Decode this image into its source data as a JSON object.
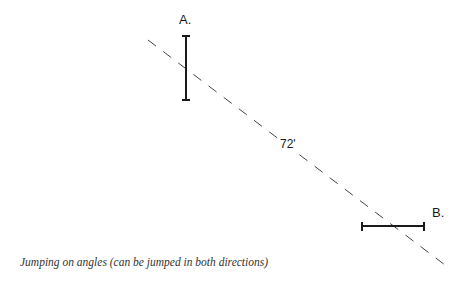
{
  "diagram": {
    "title": "Jumping on angles",
    "labels": {
      "jump_a": "A.",
      "jump_b": "B.",
      "distance": "72'"
    },
    "caption": "Jumping on angles (can be jumped in both directions)",
    "colors": {
      "line": "#1a1a1a",
      "dash": "#444444",
      "background": "#ffffff"
    },
    "elements": {
      "path_line": {
        "type": "dashed",
        "from": [
          148,
          40
        ],
        "to": [
          445,
          265
        ]
      },
      "jump_a": {
        "orientation": "vertical",
        "x": 186,
        "y1": 36,
        "y2": 100
      },
      "jump_b": {
        "orientation": "horizontal",
        "y": 226,
        "x1": 362,
        "x2": 424
      }
    }
  }
}
